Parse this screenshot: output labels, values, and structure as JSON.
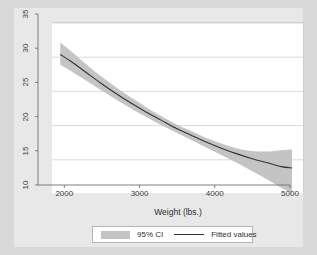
{
  "chart_data": {
    "type": "line",
    "title": "",
    "subtitle": "",
    "xlabel": "Weight (lbs.)",
    "ylabel": "",
    "xlim": [
      1650,
      5000
    ],
    "ylim": [
      10,
      35
    ],
    "xticks": [
      2000,
      3000,
      4000,
      5000
    ],
    "yticks": [
      10,
      15,
      20,
      25,
      30,
      35
    ],
    "xtick_labels": [
      "2000",
      "3000",
      "4000",
      "5000"
    ],
    "ytick_labels": [
      "10",
      "15",
      "20",
      "25",
      "30",
      "35"
    ],
    "grid": "horizontal",
    "legend_position": "bottom-outside",
    "series": [
      {
        "name": "95% CI",
        "type": "band",
        "color": "#c4c4c4",
        "x": [
          1760,
          1900,
          2100,
          2300,
          2500,
          2700,
          2900,
          3100,
          3300,
          3500,
          3700,
          3900,
          4100,
          4300,
          4500,
          4700,
          4840
        ],
        "lower": [
          28.9,
          28.0,
          26.6,
          25.2,
          23.8,
          22.5,
          21.3,
          20.1,
          19.0,
          17.9,
          16.8,
          15.7,
          14.6,
          13.4,
          12.2,
          10.9,
          10.1
        ],
        "upper": [
          32.1,
          30.9,
          29.0,
          27.2,
          25.6,
          24.1,
          22.7,
          21.4,
          20.2,
          19.2,
          18.2,
          17.4,
          16.7,
          16.3,
          16.2,
          16.4,
          16.5
        ]
      },
      {
        "name": "Fitted values",
        "type": "line",
        "color": "#333333",
        "x": [
          1760,
          1900,
          2100,
          2300,
          2500,
          2700,
          2900,
          3100,
          3300,
          3500,
          3700,
          3900,
          4100,
          4300,
          4500,
          4700,
          4840
        ],
        "y": [
          30.4,
          29.4,
          27.8,
          26.2,
          24.7,
          23.3,
          22.0,
          20.8,
          19.6,
          18.6,
          17.6,
          16.7,
          15.9,
          15.2,
          14.6,
          14.0,
          13.8
        ]
      }
    ],
    "legend": [
      {
        "label": "95% CI",
        "marker": "band",
        "color": "#c4c4c4"
      },
      {
        "label": "Fitted values",
        "marker": "line",
        "color": "#333333"
      }
    ],
    "colors": {
      "figure_background": "#d9d9d9",
      "inner_background": "#e8e8e8",
      "plot_background": "#ffffff",
      "grid": "#d2d2d2",
      "axis": "#6f6f6f",
      "text": "#2e2e2e"
    }
  }
}
